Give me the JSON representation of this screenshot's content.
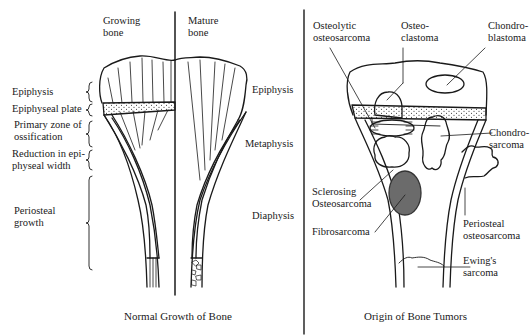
{
  "left_panel": {
    "caption": "Normal Growth of Bone",
    "col_headers": {
      "growing": [
        "Growing",
        "bone"
      ],
      "mature": [
        "Mature",
        "bone"
      ]
    },
    "left_labels": [
      {
        "text": [
          "Epiphysis"
        ]
      },
      {
        "text": [
          "Epiphyseal plate"
        ]
      },
      {
        "text": [
          "Primary zone of",
          "ossification"
        ]
      },
      {
        "text": [
          "Reduction in epi-",
          "physeal width"
        ]
      },
      {
        "text": [
          "Periosteal",
          "growth"
        ]
      }
    ],
    "right_labels": [
      {
        "text": "Epiphysis"
      },
      {
        "text": "Metaphysis"
      },
      {
        "text": "Diaphysis"
      }
    ]
  },
  "right_panel": {
    "caption": "Origin of Bone Tumors",
    "tumors": [
      {
        "name": [
          "Osteolytic",
          "osteosarcoma"
        ]
      },
      {
        "name": [
          "Osteo-",
          "clastoma"
        ]
      },
      {
        "name": [
          "Chondro-",
          "blastoma"
        ]
      },
      {
        "name": [
          "Chondro-",
          "sarcoma"
        ]
      },
      {
        "name": [
          "Sclerosing",
          "Osteosarcoma"
        ]
      },
      {
        "name": [
          "Fibrosarcoma"
        ]
      },
      {
        "name": [
          "Periosteal",
          "osteosarcoma"
        ]
      },
      {
        "name": [
          "Ewing's",
          "sarcoma"
        ]
      }
    ]
  },
  "colors": {
    "ink": "#1a1a1a",
    "fibrosarcoma_fill": "#6b6b6b",
    "background": "#ffffff"
  }
}
